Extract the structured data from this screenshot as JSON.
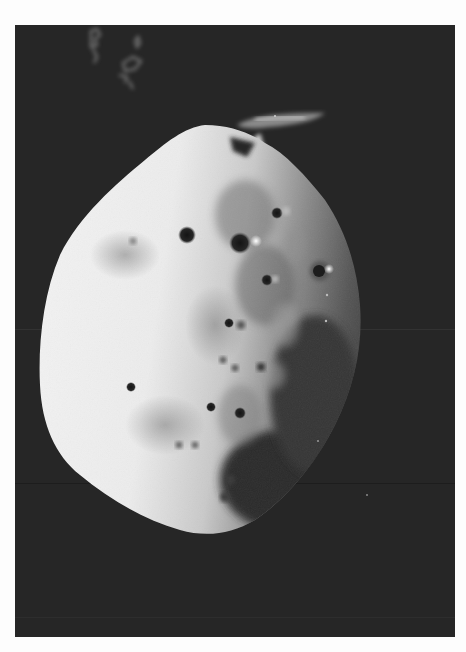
{
  "image": {
    "subject": "Cratered irregular moon photographed in black and white against dark space",
    "colors": {
      "margin": "#fdfdfd",
      "space": "#262626",
      "surface_bright": "#f2f2f2",
      "surface_mid": "#b8b8b8",
      "terminator_dark": "#3a3a3a",
      "crater_dark": "#1e1e1e",
      "crater_rim_bright": "#ffffff"
    },
    "frame": {
      "x": 15,
      "y": 25,
      "width": 440,
      "height": 612
    },
    "annotations": {
      "top_left_marks": "handwritten-like scribble marks (illegible)"
    }
  }
}
